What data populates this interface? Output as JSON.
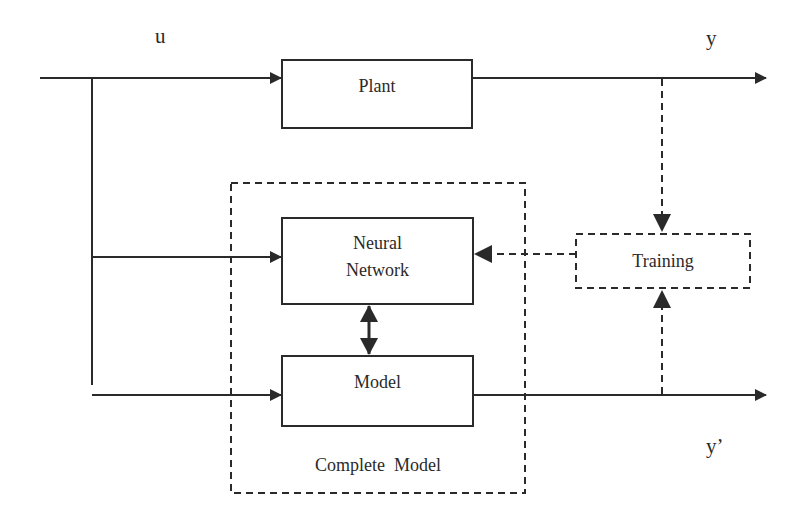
{
  "diagram": {
    "signals": {
      "input": "u",
      "plant_output": "y",
      "model_output": "y’"
    },
    "blocks": {
      "plant": "Plant",
      "neural_network_line1": "Neural",
      "neural_network_line2": "Network",
      "model": "Model",
      "training": "Training",
      "complete_model": "Complete  Model"
    },
    "colors": {
      "stroke": "#2a2a2a",
      "background": "#ffffff"
    }
  }
}
